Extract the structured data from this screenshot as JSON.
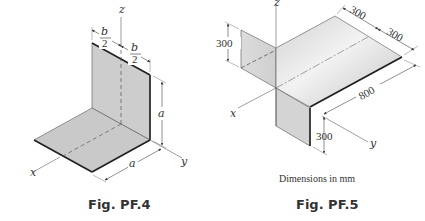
{
  "figures": [
    {
      "id": "PF.4",
      "caption": "Fig. PF.4",
      "axes": {
        "x": "x",
        "y": "y",
        "z": "z"
      },
      "dimensions": {
        "half_width_left": {
          "numerator": "b",
          "denominator": "2"
        },
        "half_width_right": {
          "numerator": "b",
          "denominator": "2"
        },
        "vertical_height": "a",
        "horizontal_depth": "a"
      },
      "description": "L-shaped bent plate: vertical plate of width b and height a in the y-z plane, horizontal plate a × b in the x-y plane"
    },
    {
      "id": "PF.5",
      "caption": "Fig. PF.5",
      "note": "Dimensions in mm",
      "axes": {
        "x": "x",
        "y": "y",
        "z": "z"
      },
      "dimensions": {
        "upper_flange_height": "300",
        "top_width_left": "300",
        "top_width_right": "300",
        "length": "800",
        "lower_flange_height": "300"
      },
      "description": "Bent sheet with a 600 × 800 horizontal plate, a 300 mm upward flange at the back edge and a 300 mm downward flange at the front edge"
    }
  ]
}
